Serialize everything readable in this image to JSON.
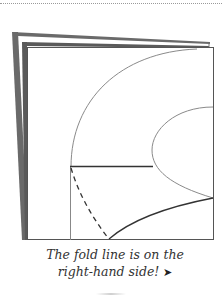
{
  "diagram": {
    "caption_line1": "The fold line is on the",
    "caption_line2": "right-hand side!",
    "arrow_glyph": "➤",
    "colors": {
      "sheet_edge": "#555555",
      "curve": "#8a8a8a",
      "cut_line": "#333333",
      "dashed_line": "#333333",
      "background": "#ffffff"
    }
  }
}
